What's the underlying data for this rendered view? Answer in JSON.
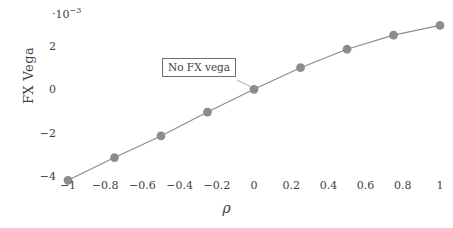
{
  "chart_data": {
    "type": "line",
    "title": "",
    "subtitle": "",
    "xlabel": "ρ",
    "ylabel": "FX Vega",
    "y_multiplier_label": "·10",
    "y_multiplier_exponent": "−3",
    "y_scale": 0.001,
    "x": [
      -1,
      -0.75,
      -0.5,
      -0.25,
      0,
      0.25,
      0.5,
      0.75,
      1
    ],
    "values": [
      -0.0042,
      -0.00315,
      -0.00215,
      -0.00105,
      0,
      0.001,
      0.00185,
      0.0025,
      0.00295
    ],
    "values_scaled": [
      -4.2,
      -3.15,
      -2.15,
      -1.05,
      0,
      1.0,
      1.85,
      2.5,
      2.95
    ],
    "series": [
      {
        "name": "FX Vega",
        "values": [
          -4.2,
          -3.15,
          -2.15,
          -1.05,
          0,
          1.0,
          1.85,
          2.5,
          2.95
        ]
      }
    ],
    "xlim": [
      -1.07,
      1.07
    ],
    "ylim": [
      -4.7,
      3.45
    ],
    "xticks": [
      -1,
      -0.8,
      -0.6,
      -0.4,
      -0.2,
      0,
      0.2,
      0.4,
      0.6,
      0.8,
      1
    ],
    "xtick_labels": [
      "−1",
      "−0.8",
      "−0.6",
      "−0.4",
      "−0.2",
      "0",
      "0.2",
      "0.4",
      "0.6",
      "0.8",
      "1"
    ],
    "yticks": [
      2,
      0,
      -2,
      -4
    ],
    "ytick_labels": [
      "2",
      "0",
      "−2",
      "−4"
    ],
    "grid": false,
    "legend": "none",
    "marker": "circle",
    "marker_size": 4.4,
    "line_color": "#8c8c8c",
    "marker_color": "#8c8c8c",
    "text_color": "#3f3f3f",
    "background": "#ffffff",
    "annotations": [
      {
        "text": "No FX vega",
        "points_to_x": 0,
        "points_to_y": 0,
        "border_color": "#6e6e6e"
      }
    ]
  }
}
